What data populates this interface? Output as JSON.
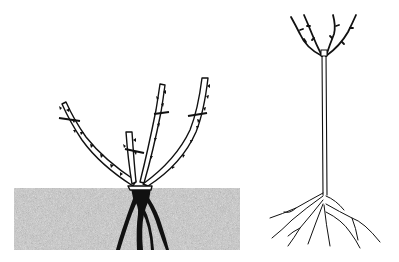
{
  "figure": {
    "description": "Line illustration of two rose plants",
    "left_plant": {
      "label": "bush-rose-pruned",
      "stems": 4,
      "pruning_cuts": 4,
      "soil_color": "#c8c8c8"
    },
    "right_plant": {
      "label": "standard-rose",
      "crown_stems": 4
    },
    "colors": {
      "ink": "#111111",
      "background": "#ffffff",
      "soil": "#c4c4c4"
    }
  }
}
